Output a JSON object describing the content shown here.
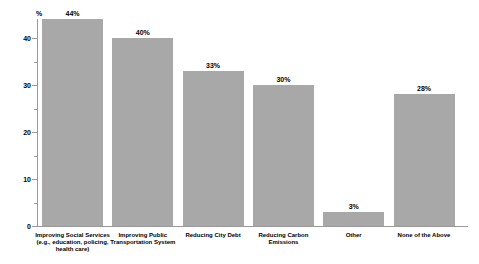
{
  "chart_data": {
    "type": "bar",
    "title": "",
    "xlabel": "",
    "ylabel": "%",
    "categories": [
      "Improving Social Services\n(e.g., education, policing,\nhealth care)",
      "Improving Public\nTransportation System",
      "Reducing City Debt",
      "Reducing Carbon\nEmissions",
      "Other",
      "None of the Above"
    ],
    "values": [
      44,
      40,
      33,
      30,
      3,
      28
    ],
    "value_labels": [
      "44%",
      "40%",
      "33%",
      "30%",
      "3%",
      "28%"
    ],
    "yticks": [
      0,
      10,
      20,
      30,
      40
    ],
    "minor_yticks": [
      5,
      15,
      25,
      35
    ],
    "ylim": [
      0,
      45
    ],
    "grid": false,
    "legend": false,
    "bar_color": "#a8a8a8",
    "axis_color": "#9a9a9a",
    "text_color": "#000000",
    "background_color": "#ffffff"
  }
}
